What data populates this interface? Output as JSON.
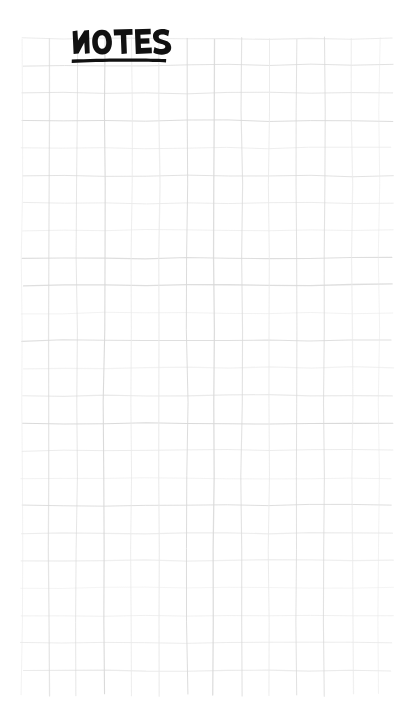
{
  "page": {
    "kind": "handwritten-notes-page",
    "width": 405,
    "height": 714,
    "background_color": "#ffffff",
    "title_text": "NOTES",
    "title_style": "hand-lettered bold capitals, underlined",
    "title_color": "#111111",
    "underline_color": "#111111"
  },
  "grid": {
    "label": "graph-paper-grid",
    "line_color": "#d8d8d8",
    "line_color_faint": "#e9e9e9",
    "cell_size_px": 27.5,
    "left_px": 22,
    "top_px": 38,
    "right_px": 392,
    "bottom_px": 695,
    "columns": 14,
    "rows": 24,
    "style": "hand-drawn, slightly wavy and irregular"
  },
  "content": {
    "body_text": "",
    "note": "blank ruled note page"
  }
}
